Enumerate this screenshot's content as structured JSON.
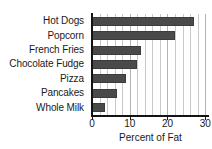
{
  "chart_data": {
    "type": "bar",
    "orientation": "horizontal",
    "title": "",
    "xlabel": "Percent of Fat",
    "ylabel": "",
    "categories": [
      "Hot Dogs",
      "Popcorn",
      "French Fries",
      "Chocolate Fudge",
      "Pizza",
      "Pancakes",
      "Whole Milk"
    ],
    "values": [
      27,
      22,
      13,
      12,
      9,
      6.5,
      3.5
    ],
    "xlim": [
      0,
      31
    ],
    "xticks": [
      0,
      10,
      20,
      30
    ],
    "xtick_labels": [
      "0",
      "10",
      "20",
      "30"
    ],
    "minor_gridline_step": 2,
    "grid": true,
    "legend": false,
    "bar_color": "#4a4a4a",
    "gridline_color": "#c9c9c9",
    "axis_color": "#141414",
    "background_color": "#ffffff"
  }
}
